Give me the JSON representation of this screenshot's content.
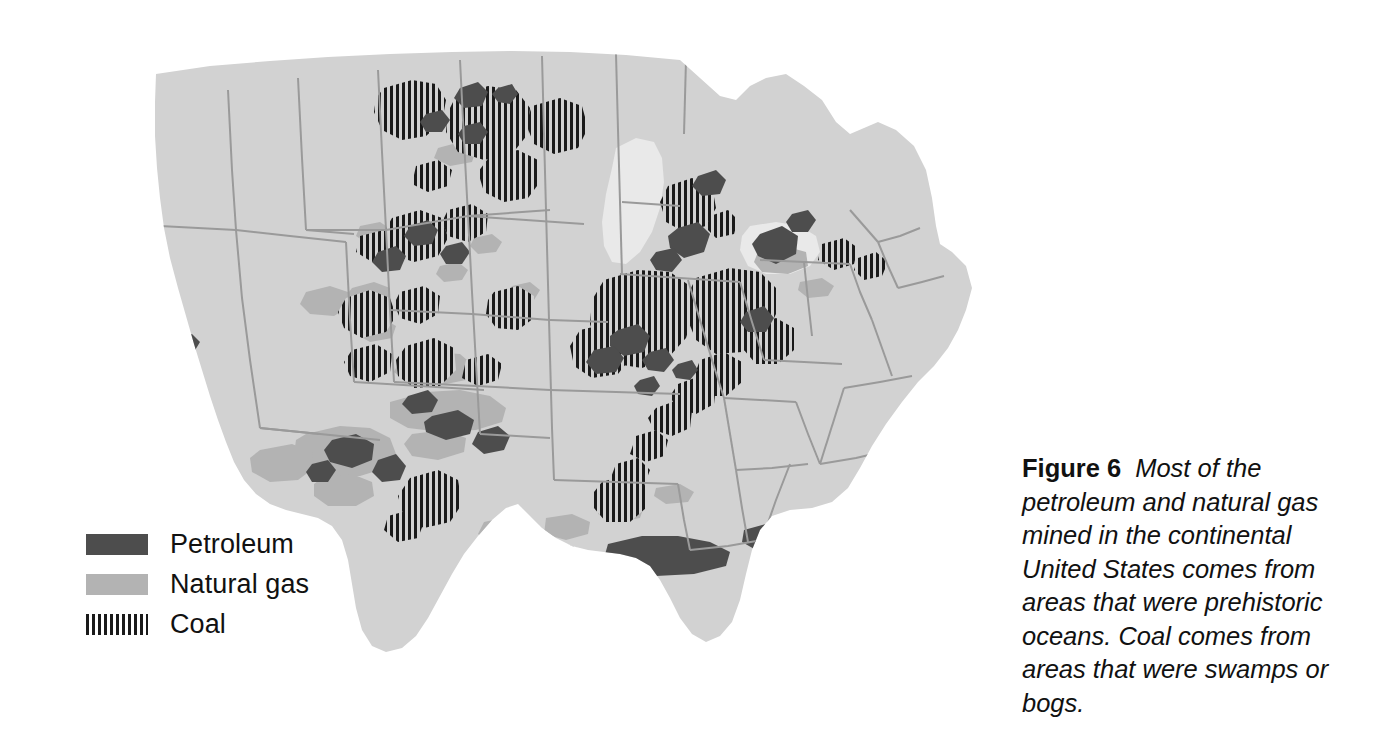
{
  "figure": {
    "label": "Figure 6",
    "caption": "Most of the petroleum and natural gas mined in the continental United States comes from areas that were prehistoric oceans. Coal comes from areas that were swamps or bogs."
  },
  "legend": {
    "items": [
      {
        "label": "Petroleum",
        "swatch": "solid-dark-gray",
        "color": "#4d4d4d"
      },
      {
        "label": "Natural gas",
        "swatch": "solid-light-gray",
        "color": "#b3b3b3"
      },
      {
        "label": "Coal",
        "swatch": "vertical-stripes",
        "color": "#1a1a1a"
      }
    ]
  },
  "map": {
    "title": "Continental United States fossil fuel resources",
    "region": "Continental United States",
    "colors": {
      "land": "#d2d2d2",
      "water": "#e9e9e9",
      "border": "#9a9a9a",
      "petroleum": "#4d4d4d",
      "natural_gas": "#b3b3b3",
      "coal": "#1a1a1a",
      "background": "#ffffff"
    },
    "resources": [
      {
        "name": "Petroleum",
        "regions": [
          "Coastal California",
          "Gulf Coast of Texas and Louisiana",
          "West Texas Permian Basin",
          "Oklahoma",
          "Wyoming",
          "Williston Basin, North Dakota",
          "Michigan",
          "Illinois",
          "Appalachian Ohio and Pennsylvania"
        ]
      },
      {
        "name": "Natural gas",
        "regions": [
          "West Texas and New Mexico",
          "Oklahoma and Kansas",
          "Gulf Coast",
          "Four Corners",
          "Appalachian basin",
          "Rocky Mountains"
        ]
      },
      {
        "name": "Coal",
        "regions": [
          "Appalachian Mountains",
          "Illinois Basin",
          "Powder River Basin, Wyoming and Montana",
          "Western North Dakota",
          "Utah and Colorado",
          "Eastern Kentucky and West Virginia",
          "Alabama",
          "Texas Gulf lignite",
          "Michigan"
        ]
      }
    ]
  }
}
